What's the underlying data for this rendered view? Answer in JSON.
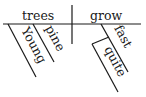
{
  "diagram": {
    "type": "sentence-diagram",
    "sentence_words": {
      "subject": "trees",
      "predicate": "grow",
      "subject_modifiers": [
        "Young",
        "pine"
      ],
      "predicate_modifier": "fast",
      "modifier_of_modifier": "quite"
    }
  }
}
